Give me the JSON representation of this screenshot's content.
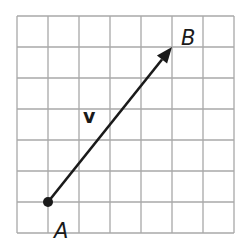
{
  "diagram": {
    "type": "vector-on-grid",
    "grid": {
      "columns": 7,
      "rows": 7,
      "origin_px": [
        17,
        16
      ],
      "cell_px": 31,
      "line_color": "#a8a8a8"
    },
    "vector": {
      "name": "v",
      "from": "A",
      "to": "B",
      "start_cell": [
        1,
        6
      ],
      "end_cell": [
        5,
        1
      ],
      "displacement_units": {
        "dx": 4,
        "dy": 5
      },
      "color": "#1a1a1a"
    },
    "labels": {
      "start_point": "A",
      "end_point": "B",
      "vector": "v"
    }
  }
}
